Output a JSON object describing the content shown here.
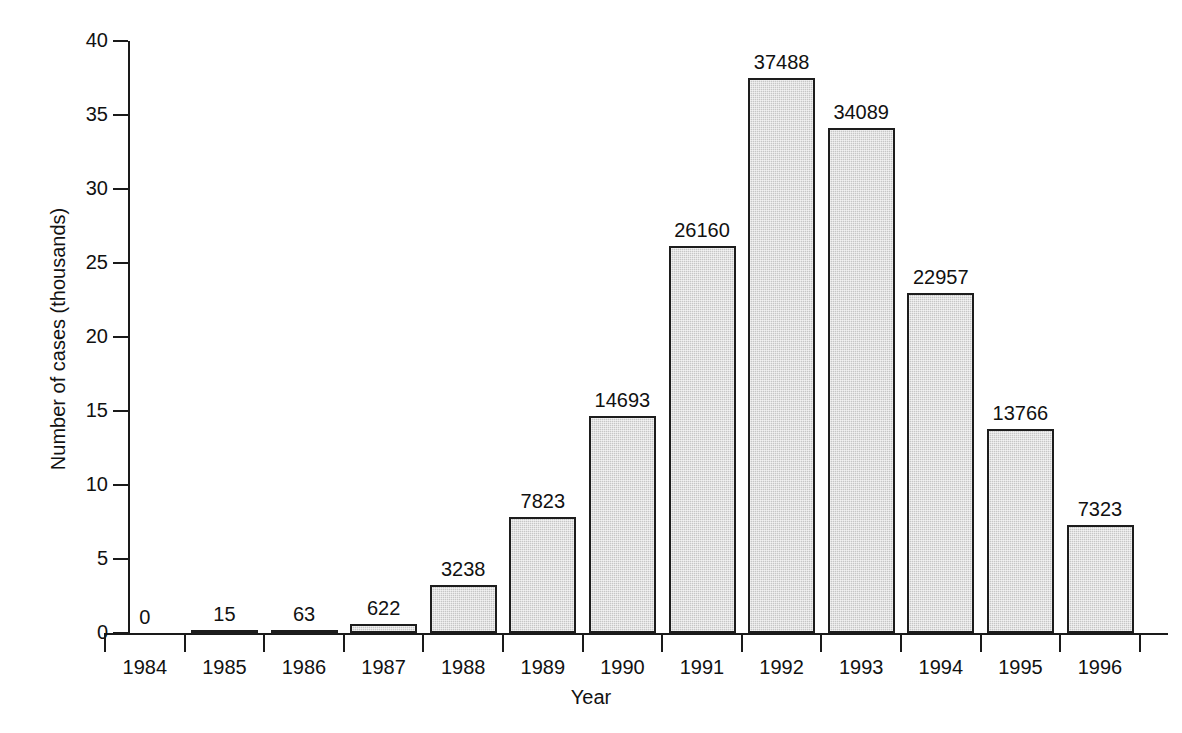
{
  "chart_data": {
    "type": "bar",
    "title": "",
    "xlabel": "Year",
    "ylabel": "Number of cases (thousands)",
    "categories": [
      "1984",
      "1985",
      "1986",
      "1987",
      "1988",
      "1989",
      "1990",
      "1991",
      "1992",
      "1993",
      "1994",
      "1995",
      "1996"
    ],
    "values": [
      0,
      15,
      63,
      622,
      3238,
      7823,
      14693,
      26160,
      37488,
      34089,
      22957,
      13766,
      7323
    ],
    "value_labels": [
      "0",
      "15",
      "63",
      "622",
      "3238",
      "7823",
      "14693",
      "26160",
      "37488",
      "34089",
      "22957",
      "13766",
      "7323"
    ],
    "ylim": [
      0,
      40000
    ],
    "y_axis_unit_scale": 1000,
    "y_tick_values": [
      0,
      5000,
      10000,
      15000,
      20000,
      25000,
      30000,
      35000,
      40000
    ],
    "y_tick_labels": [
      "0",
      "5",
      "10",
      "15",
      "20",
      "25",
      "30",
      "35",
      "40"
    ],
    "grid": false,
    "legend": false,
    "bar_fill_color": "#c6c6c6",
    "bar_edge_color": "#1d1d1d",
    "axis_color": "#1a1a1a",
    "background_color": "#ffffff"
  }
}
